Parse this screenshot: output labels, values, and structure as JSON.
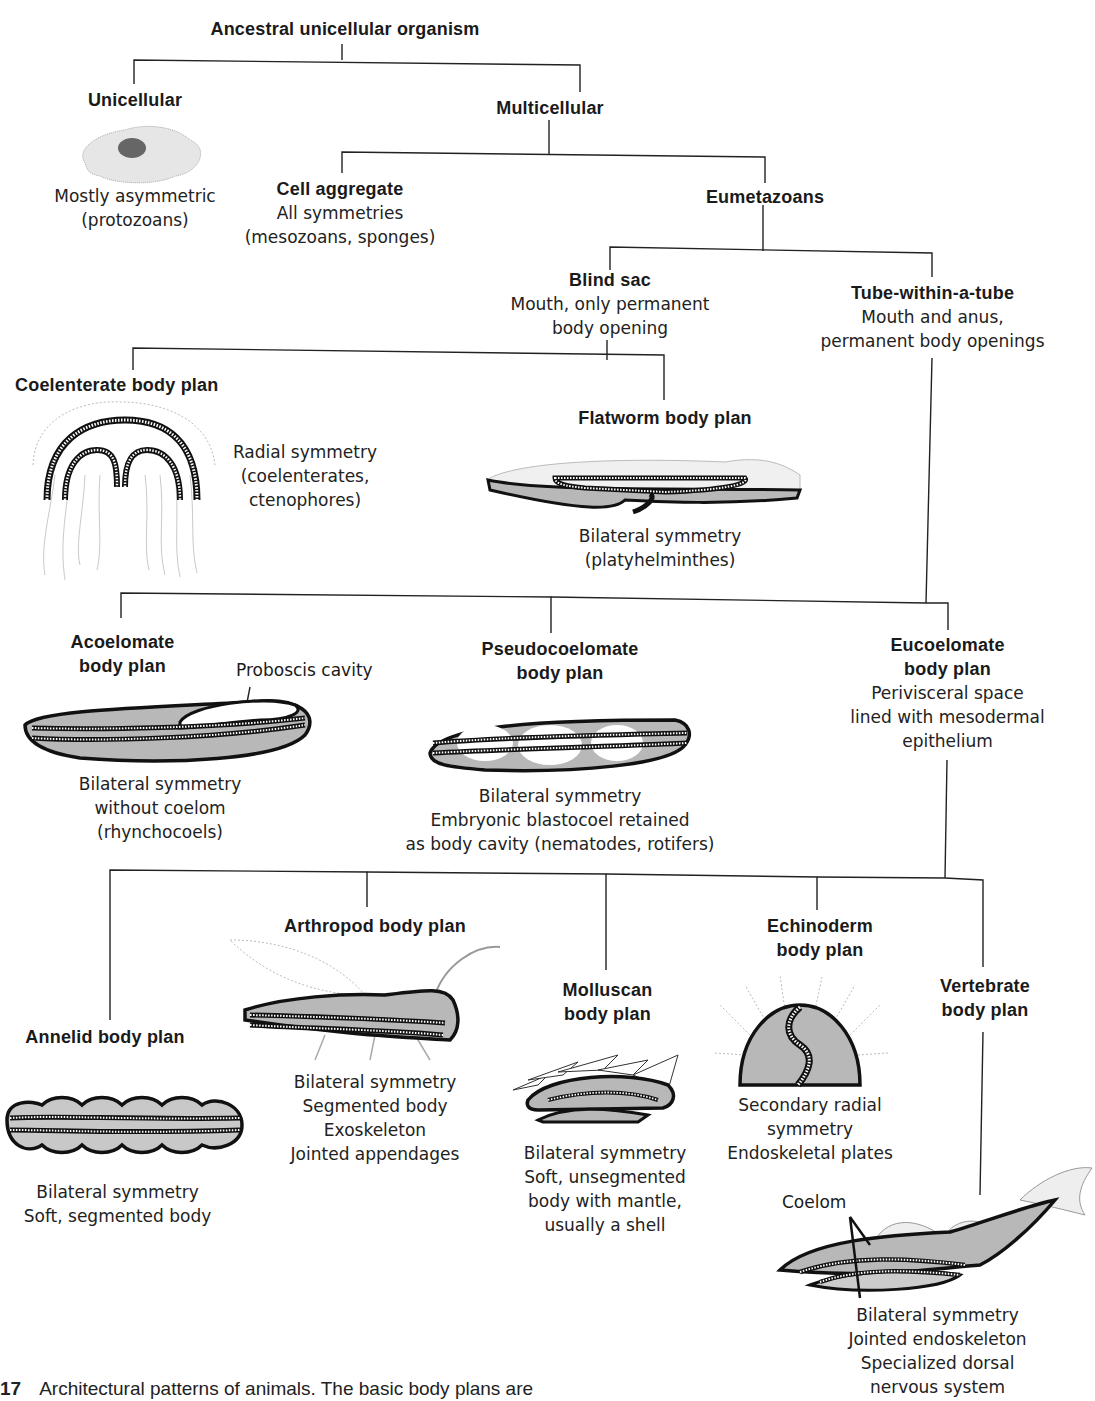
{
  "root": {
    "title": "Ancestral unicellular organism"
  },
  "unicellular": {
    "title": "Unicellular",
    "desc": [
      "Mostly asymmetric",
      "(protozoans)"
    ]
  },
  "multicellular": {
    "title": "Multicellular"
  },
  "cell_aggregate": {
    "title": "Cell aggregate",
    "desc": [
      "All symmetries",
      "(mesozoans, sponges)"
    ]
  },
  "eumetazoans": {
    "title": "Eumetazoans"
  },
  "blind_sac": {
    "title": "Blind sac",
    "desc": [
      "Mouth, only permanent",
      "body opening"
    ]
  },
  "tube": {
    "title": "Tube-within-a-tube",
    "desc": [
      "Mouth and anus,",
      "permanent body openings"
    ]
  },
  "coelenterate": {
    "title": "Coelenterate body plan",
    "desc": [
      "Radial symmetry",
      "(coelenterates,",
      "ctenophores)"
    ]
  },
  "flatworm": {
    "title": "Flatworm body plan",
    "desc": [
      "Bilateral symmetry",
      "(platyhelminthes)"
    ]
  },
  "acoelomate": {
    "title": [
      "Acoelomate",
      "body plan"
    ],
    "desc": [
      "Bilateral symmetry",
      "without coelom",
      "(rhynchocoels)"
    ],
    "annotation": "Proboscis cavity"
  },
  "pseudocoelomate": {
    "title": [
      "Pseudocoelomate",
      "body plan"
    ],
    "desc": [
      "Bilateral symmetry",
      "Embryonic blastocoel retained",
      "as body cavity (nematodes, rotifers)"
    ]
  },
  "eucoelomate": {
    "title": [
      "Eucoelomate",
      "body plan"
    ],
    "desc": [
      "Perivisceral space",
      "lined with mesodermal",
      "epithelium"
    ]
  },
  "annelid": {
    "title": "Annelid body plan",
    "desc": [
      "Bilateral symmetry",
      "Soft, segmented body"
    ]
  },
  "arthropod": {
    "title": "Arthropod body plan",
    "desc": [
      "Bilateral symmetry",
      "Segmented body",
      "Exoskeleton",
      "Jointed appendages"
    ]
  },
  "molluscan": {
    "title": [
      "Molluscan",
      "body plan"
    ],
    "desc": [
      "Bilateral symmetry",
      "Soft, unsegmented",
      "body with mantle,",
      "usually a shell"
    ]
  },
  "echinoderm": {
    "title": [
      "Echinoderm",
      "body plan"
    ],
    "desc": [
      "Secondary radial",
      "symmetry",
      "Endoskeletal plates"
    ]
  },
  "vertebrate": {
    "title": [
      "Vertebrate",
      "body plan"
    ],
    "desc": [
      "Bilateral symmetry",
      "Jointed endoskeleton",
      "Specialized dorsal",
      "nervous system"
    ],
    "annotation": "Coelom"
  },
  "caption": {
    "number": "17",
    "text": "Architectural patterns of animals. The basic body plans are"
  },
  "colors": {
    "line": "#222222",
    "body_fill": "#b8b8b8",
    "outline": "#111111"
  }
}
